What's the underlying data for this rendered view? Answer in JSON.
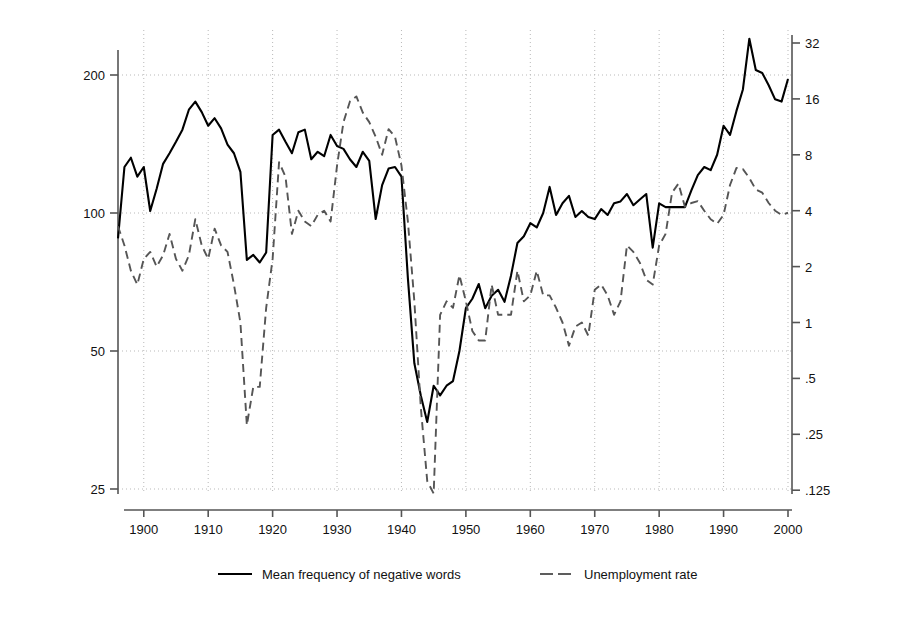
{
  "chart_data": {
    "type": "line",
    "title": "",
    "xlabel": "",
    "ylabel": "Negative rhetoric",
    "y2label": "Unemployment rate",
    "grid": true,
    "legend_position": "bottom",
    "xlim": [
      1896,
      2000
    ],
    "xticks": [
      1900,
      1910,
      1920,
      1930,
      1940,
      1950,
      1960,
      1970,
      1980,
      1990,
      2000
    ],
    "xticklabels": [
      "1900",
      "1910",
      "1920",
      "1930",
      "1940",
      "1950",
      "1960",
      "1970",
      "1980",
      "1990",
      "2000"
    ],
    "yscale": "log",
    "ylim": [
      25,
      240
    ],
    "yticks": [
      25,
      50,
      100,
      200
    ],
    "yticklabels": [
      "25",
      "50",
      "100",
      "200"
    ],
    "y2scale": "log",
    "y2lim": [
      0.115,
      36
    ],
    "y2ticks": [
      0.125,
      0.25,
      0.5,
      1,
      2,
      4,
      8,
      16,
      32
    ],
    "y2ticklabels": [
      ".125",
      ".25",
      ".5",
      "1",
      "2",
      "4",
      "8",
      "16",
      "32"
    ],
    "series": [
      {
        "name": "Mean frequency of negative words",
        "axis": "left",
        "style": "solid",
        "color": "#000000",
        "x": [
          1896,
          1897,
          1898,
          1899,
          1900,
          1901,
          1902,
          1903,
          1904,
          1905,
          1906,
          1907,
          1908,
          1909,
          1910,
          1911,
          1912,
          1913,
          1914,
          1915,
          1916,
          1917,
          1918,
          1919,
          1920,
          1921,
          1922,
          1923,
          1924,
          1925,
          1926,
          1927,
          1928,
          1929,
          1930,
          1931,
          1932,
          1933,
          1934,
          1935,
          1936,
          1937,
          1938,
          1939,
          1940,
          1941,
          1942,
          1943,
          1944,
          1945,
          1946,
          1947,
          1948,
          1949,
          1950,
          1951,
          1952,
          1953,
          1954,
          1955,
          1956,
          1957,
          1958,
          1959,
          1960,
          1961,
          1962,
          1963,
          1964,
          1965,
          1966,
          1967,
          1968,
          1969,
          1970,
          1971,
          1972,
          1973,
          1974,
          1975,
          1976,
          1977,
          1978,
          1979,
          1980,
          1981,
          1982,
          1983,
          1984,
          1985,
          1986,
          1987,
          1988,
          1989,
          1990,
          1991,
          1992,
          1993,
          1994,
          1995,
          1996,
          1997,
          1998,
          1999,
          2000
        ],
        "y": [
          88,
          126,
          132,
          120,
          126,
          101,
          113,
          128,
          135,
          143,
          152,
          168,
          175,
          166,
          155,
          161,
          153,
          141,
          135,
          123,
          79,
          81,
          78,
          82,
          148,
          152,
          143,
          135,
          150,
          152,
          131,
          136,
          133,
          148,
          140,
          138,
          131,
          126,
          136,
          130,
          97,
          115,
          125,
          126,
          120,
          72,
          47,
          40,
          35,
          42,
          40,
          42,
          43,
          50,
          62,
          65,
          70,
          62,
          66,
          68,
          64,
          73,
          86,
          89,
          95,
          93,
          100,
          114,
          99,
          105,
          109,
          98,
          101,
          98,
          97,
          102,
          99,
          105,
          106,
          110,
          104,
          107,
          110,
          84,
          105,
          103,
          103,
          103,
          103,
          112,
          121,
          126,
          124,
          134,
          155,
          148,
          167,
          186,
          240,
          205,
          202,
          190,
          177,
          175,
          196
        ]
      },
      {
        "name": "Unemployment rate",
        "axis": "right",
        "style": "dashed",
        "color": "#555555",
        "x": [
          1896,
          1897,
          1898,
          1899,
          1900,
          1901,
          1902,
          1903,
          1904,
          1905,
          1906,
          1907,
          1908,
          1909,
          1910,
          1911,
          1912,
          1913,
          1914,
          1915,
          1916,
          1917,
          1918,
          1919,
          1920,
          1921,
          1922,
          1923,
          1924,
          1925,
          1926,
          1927,
          1928,
          1929,
          1930,
          1931,
          1932,
          1933,
          1934,
          1935,
          1936,
          1937,
          1938,
          1939,
          1940,
          1941,
          1942,
          1943,
          1944,
          1945,
          1946,
          1947,
          1948,
          1949,
          1950,
          1951,
          1952,
          1953,
          1954,
          1955,
          1956,
          1957,
          1958,
          1959,
          1960,
          1961,
          1962,
          1963,
          1964,
          1965,
          1966,
          1967,
          1968,
          1969,
          1970,
          1971,
          1972,
          1973,
          1974,
          1975,
          1976,
          1977,
          1978,
          1979,
          1980,
          1981,
          1982,
          1983,
          1984,
          1985,
          1986,
          1987,
          1988,
          1989,
          1990,
          1991,
          1992,
          1993,
          1994,
          1995,
          1996,
          1997,
          1998,
          1999,
          2000
        ],
        "y": [
          3.3,
          2.6,
          1.9,
          1.6,
          2.2,
          2.4,
          2.0,
          2.3,
          3.0,
          2.2,
          1.9,
          2.3,
          3.6,
          2.6,
          2.2,
          3.2,
          2.6,
          2.4,
          1.6,
          1.0,
          0.28,
          0.45,
          0.45,
          1.2,
          2.2,
          7.3,
          6.1,
          3.0,
          4.0,
          3.5,
          3.3,
          3.8,
          4.0,
          3.5,
          7.0,
          12.0,
          15.5,
          16.5,
          13.5,
          12.0,
          10.0,
          8.0,
          11.0,
          10.0,
          7.0,
          3.5,
          1.3,
          0.35,
          0.14,
          0.12,
          1.1,
          1.3,
          1.2,
          1.8,
          1.3,
          0.9,
          0.8,
          0.8,
          1.6,
          1.1,
          1.1,
          1.1,
          1.9,
          1.3,
          1.4,
          1.9,
          1.4,
          1.4,
          1.2,
          1.0,
          0.75,
          0.95,
          1.0,
          0.85,
          1.5,
          1.6,
          1.4,
          1.1,
          1.3,
          2.6,
          2.4,
          2.1,
          1.7,
          1.6,
          2.6,
          3.0,
          5.0,
          5.6,
          4.2,
          4.4,
          4.5,
          4.0,
          3.6,
          3.4,
          3.8,
          5.5,
          6.8,
          6.7,
          6.0,
          5.2,
          5.0,
          4.4,
          4.0,
          3.8,
          3.9
        ]
      }
    ],
    "legend": [
      {
        "label": "Mean frequency of negative words",
        "style": "solid",
        "color": "#000000"
      },
      {
        "label": "Unemployment rate",
        "style": "dashed",
        "color": "#555555"
      }
    ]
  }
}
